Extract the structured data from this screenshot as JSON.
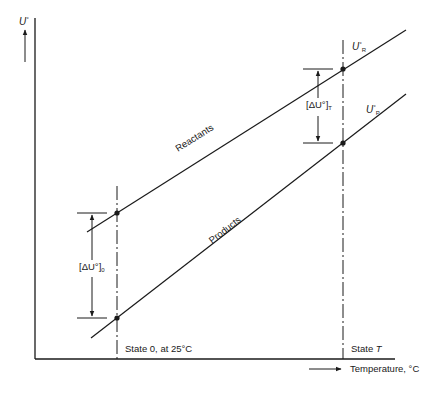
{
  "diagram": {
    "y_axis": {
      "symbol": "U",
      "superscript": "°"
    },
    "x_axis": {
      "label": "Temperature, °C"
    },
    "lines": [
      {
        "name": "Reactants",
        "label": "Reactants",
        "end_symbol": "U",
        "end_sup": "°",
        "end_sub": "R"
      },
      {
        "name": "Products",
        "label": "Products",
        "end_symbol": "U",
        "end_sup": "°",
        "end_sub": "P"
      }
    ],
    "states": [
      {
        "label": "State 0, at 25°C"
      },
      {
        "label_prefix": "State ",
        "label_var": "T"
      }
    ],
    "deltas": [
      {
        "text": "[ΔU°]",
        "sub": "0"
      },
      {
        "text": "[ΔU°]",
        "sub": "T"
      }
    ],
    "colors": {
      "line": "#1a1a1a",
      "background": "#ffffff"
    }
  }
}
